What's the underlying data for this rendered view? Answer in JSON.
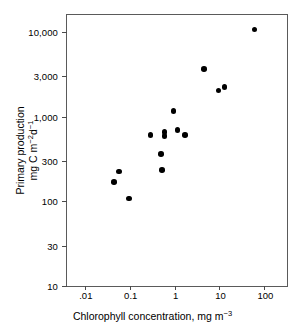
{
  "chart_data": {
    "type": "scatter",
    "title": "",
    "xlabel": "Chlorophyll concentration, mg m-3",
    "ylabel": "Primary production mg C m-2d-1",
    "xlabel_parts": {
      "main": "Chlorophyll concentration, mg m",
      "sup": "−3"
    },
    "ylabel_parts": {
      "line1": "Primary production",
      "line2_main": "mg C m",
      "line2_sup1": "−2",
      "line2_mid": "d",
      "line2_sup2": "−1"
    },
    "xscale": "log",
    "yscale": "log",
    "xlim": [
      0.004,
      320
    ],
    "ylim": [
      10,
      16000
    ],
    "grid": false,
    "legend": null,
    "xticks": [
      0.01,
      0.1,
      1,
      10,
      100
    ],
    "xticklabels": [
      ".01",
      "0.1",
      "1",
      "10",
      "100"
    ],
    "yticks": [
      10,
      30,
      100,
      300,
      1000,
      3000,
      10000
    ],
    "yticklabels": [
      "10",
      "30",
      "100",
      "300",
      "1,000",
      "3,000",
      "10,000"
    ],
    "marker": "filled-circle",
    "marker_color": "#000000",
    "points": [
      {
        "x": 0.045,
        "y": 170
      },
      {
        "x": 0.058,
        "y": 225
      },
      {
        "x": 0.095,
        "y": 108
      },
      {
        "x": 0.29,
        "y": 610
      },
      {
        "x": 0.5,
        "y": 365
      },
      {
        "x": 0.52,
        "y": 235
      },
      {
        "x": 0.6,
        "y": 660
      },
      {
        "x": 0.6,
        "y": 590
      },
      {
        "x": 0.95,
        "y": 1180
      },
      {
        "x": 1.15,
        "y": 700
      },
      {
        "x": 1.7,
        "y": 610
      },
      {
        "x": 4.5,
        "y": 3700
      },
      {
        "x": 9.5,
        "y": 2050
      },
      {
        "x": 13,
        "y": 2250
      },
      {
        "x": 60,
        "y": 10800
      }
    ]
  },
  "figure": {
    "background_color": "#ffffff",
    "frame_color": "#5a5a5a"
  }
}
